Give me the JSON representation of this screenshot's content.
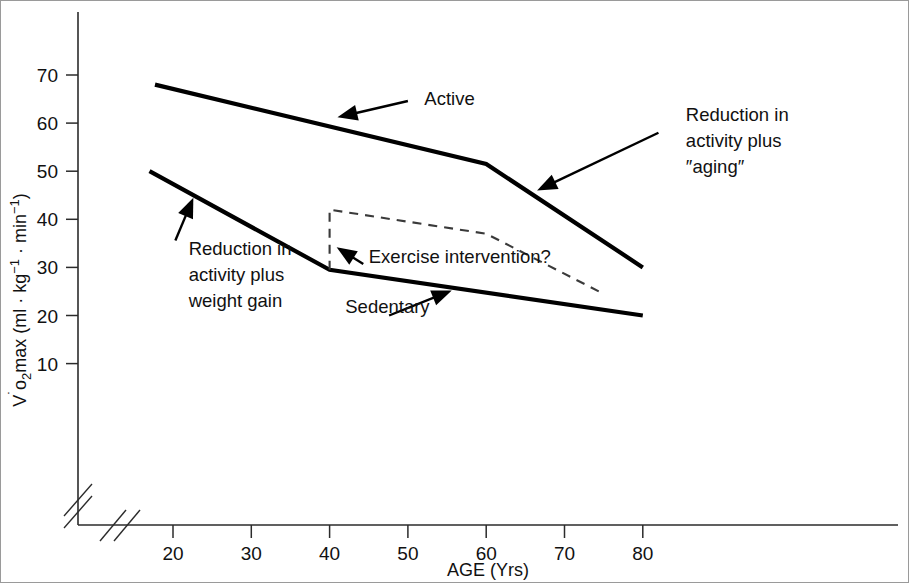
{
  "chart_data": {
    "type": "line",
    "title": "",
    "xlabel": "AGE (Yrs)",
    "ylabel": "V̇o₂max (ml · kg⁻¹ · min⁻¹)",
    "xlim": [
      15,
      85
    ],
    "ylim": [
      5,
      78
    ],
    "xticks": [
      20,
      30,
      40,
      50,
      60,
      70,
      80
    ],
    "xtick_labels": [
      "20",
      "30",
      "40",
      "50",
      "60",
      "70",
      "80"
    ],
    "yticks": [
      10,
      20,
      30,
      40,
      50,
      60,
      70
    ],
    "ytick_labels": [
      "10",
      "20",
      "30",
      "40",
      "50",
      "60",
      "70"
    ],
    "grid": false,
    "legend": "none",
    "axis_break_x": true,
    "axis_break_y": true,
    "series": [
      {
        "name": "Active",
        "style": "solid",
        "x": [
          17.7,
          60,
          80
        ],
        "values": [
          68,
          51.5,
          30
        ]
      },
      {
        "name": "Sedentary",
        "style": "solid",
        "x": [
          17.0,
          40,
          80
        ],
        "values": [
          50,
          29.5,
          20
        ]
      },
      {
        "name": "Exercise intervention?",
        "style": "dashed",
        "x": [
          40,
          40,
          60,
          75
        ],
        "values": [
          29.5,
          42,
          37,
          24.5
        ]
      }
    ],
    "annotations": [
      {
        "id": "active",
        "text": "Active",
        "lines": [
          "Active"
        ],
        "label_x": 52.1,
        "label_y": 63.8,
        "point_x": 41.0,
        "point_y": 61.2
      },
      {
        "id": "reduction-aging",
        "text": "Reduction in activity plus “aging”",
        "lines": [
          "Reduction in",
          "activity plus",
          "″aging″"
        ],
        "label_x": 85.5,
        "label_y": 60.5,
        "point_x": 66.5,
        "point_y": 46.0
      },
      {
        "id": "reduction-weight-gain",
        "text": "Reduction in activity plus weight gain",
        "lines": [
          "Reduction in",
          "activity plus",
          "weight gain"
        ],
        "label_x": 22.0,
        "label_y": 32.5,
        "point_x": 22.6,
        "point_y": 44.5
      },
      {
        "id": "exercise-intervention",
        "text": "Exercise intervention?",
        "lines": [
          "Exercise intervention?"
        ],
        "label_x": 45.0,
        "label_y": 31.0,
        "point_x": 40.9,
        "point_y": 34.2
      },
      {
        "id": "sedentary",
        "text": "Sedentary",
        "lines": [
          "Sedentary"
        ],
        "label_x": 42.0,
        "label_y": 20.5,
        "point_x": 55.6,
        "point_y": 25.2
      }
    ]
  },
  "axes": {
    "y_label_parts": {
      "v": "V",
      "dot": "̇",
      "o": "o",
      "sub2": "2",
      "max": "max",
      "unit_open": " (ml · kg",
      "sup_minus1_a": "−1",
      "mid": " · min",
      "sup_minus1_b": "−1",
      "unit_close": ")"
    },
    "y_label_full": "V̇o₂max (ml · kg⁻¹ · min⁻¹)",
    "x_label": "AGE (Yrs)"
  },
  "colors": {
    "line": "#000000",
    "dashed_line": "#3a3a3a",
    "axis": "#2b2b2b",
    "frame": "#9a9a9a",
    "background": "#ffffff"
  }
}
